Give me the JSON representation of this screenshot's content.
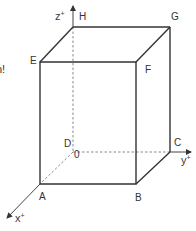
{
  "diagram": {
    "type": "3d-box-coordinate-system",
    "colors": {
      "solid_edge": "#333333",
      "hidden_edge": "#8a8a8a",
      "axis": "#555555",
      "label": "#333333",
      "background": "#ffffff"
    },
    "cut_off_text": "n!",
    "vertices": [
      {
        "name": "A",
        "label": "A",
        "role": "front-bottom-left"
      },
      {
        "name": "B",
        "label": "B",
        "role": "front-bottom-right"
      },
      {
        "name": "C",
        "label": "C",
        "role": "back-bottom-right"
      },
      {
        "name": "D",
        "label": "D",
        "role": "back-bottom-left"
      },
      {
        "name": "E",
        "label": "E",
        "role": "front-top-left"
      },
      {
        "name": "F",
        "label": "F",
        "role": "front-top-right"
      },
      {
        "name": "G",
        "label": "G",
        "role": "back-top-right"
      },
      {
        "name": "H",
        "label": "H",
        "role": "back-top-left"
      }
    ],
    "origin_label": "0",
    "axes": {
      "x": {
        "label": "x",
        "sign": "+"
      },
      "y": {
        "label": "y",
        "sign": "+"
      },
      "z": {
        "label": "z",
        "sign": "+"
      }
    }
  }
}
